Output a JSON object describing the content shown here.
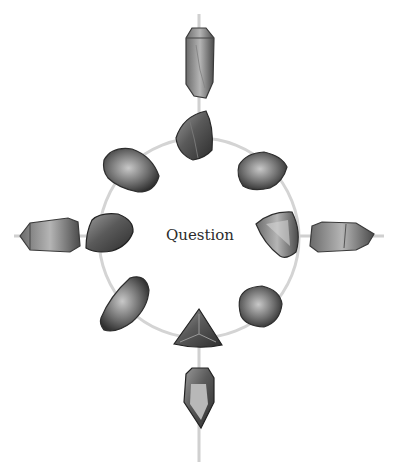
{
  "diagram": {
    "center_label": "Question",
    "ring": {
      "cx": 199,
      "cy": 238,
      "r": 100,
      "color": "#d4d4d4"
    },
    "axis_color": "#d0d0d0",
    "stones_on_ring": [
      {
        "name": "top",
        "shape": "triangle-rounded"
      },
      {
        "name": "top-right",
        "shape": "oval"
      },
      {
        "name": "right",
        "shape": "triangle"
      },
      {
        "name": "bottom-right",
        "shape": "pebble"
      },
      {
        "name": "bottom",
        "shape": "triangle"
      },
      {
        "name": "bottom-left",
        "shape": "half-oval"
      },
      {
        "name": "left",
        "shape": "pebble"
      },
      {
        "name": "top-left",
        "shape": "oval"
      }
    ],
    "crystals": [
      {
        "name": "north",
        "direction": "up"
      },
      {
        "name": "east",
        "direction": "right"
      },
      {
        "name": "south",
        "direction": "down"
      },
      {
        "name": "west",
        "direction": "left"
      }
    ]
  }
}
